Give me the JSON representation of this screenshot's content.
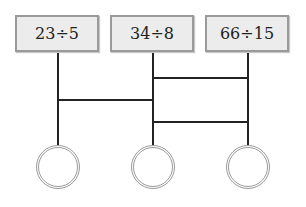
{
  "diagram": {
    "expressions": [
      {
        "label": "23÷5"
      },
      {
        "label": "34÷8"
      },
      {
        "label": "66÷15"
      }
    ],
    "answer_circles": [
      {
        "value": ""
      },
      {
        "value": ""
      },
      {
        "value": ""
      }
    ],
    "colors": {
      "box_fill": "#ececec",
      "box_border": "#9a9a9a",
      "line": "#222222",
      "circle_border": "#9a9a9a"
    }
  }
}
